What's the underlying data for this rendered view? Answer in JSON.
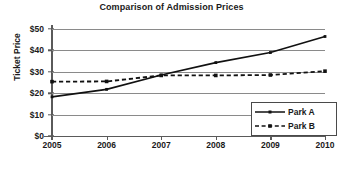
{
  "chart_data": {
    "type": "line",
    "title": "Comparison of Admission Prices",
    "xlabel": "",
    "ylabel": "Ticket Price",
    "categories": [
      "2005",
      "2006",
      "2007",
      "2008",
      "2009",
      "2010"
    ],
    "x": [
      2005,
      2006,
      2007,
      2008,
      2009,
      2010
    ],
    "ylim": [
      0,
      50
    ],
    "xlim": [
      2005,
      2010
    ],
    "ytick_labels": [
      "$0",
      "$10",
      "$20",
      "$30",
      "$40",
      "$50"
    ],
    "ytick_values": [
      0,
      10,
      20,
      30,
      40,
      50
    ],
    "grid": true,
    "legend_position": "bottom-right",
    "series": [
      {
        "name": "Park A",
        "values": [
          18.3,
          21.8,
          28.5,
          34.3,
          39.0,
          46.5
        ],
        "line_style": "solid",
        "color": "#111111",
        "marker": "dot"
      },
      {
        "name": "Park B",
        "values": [
          25.4,
          25.5,
          28.3,
          28.3,
          28.5,
          30.3
        ],
        "line_style": "dashed",
        "color": "#111111",
        "marker": "square"
      }
    ]
  },
  "legend": {
    "entries": [
      {
        "label": "Park A"
      },
      {
        "label": "Park B"
      }
    ]
  }
}
